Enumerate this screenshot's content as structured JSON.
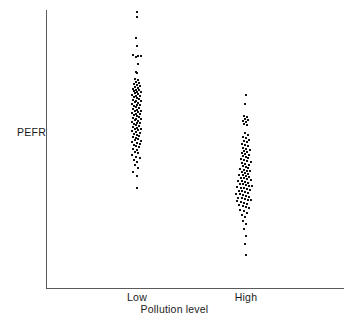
{
  "chart_data": {
    "type": "scatter",
    "title": "",
    "subtitle": "",
    "xlabel": "Pollution level",
    "ylabel": "PEFR",
    "grid": false,
    "legend": null,
    "categories": [
      "Low",
      "High"
    ],
    "marker": "small-filled-square",
    "marker_color": "#111111",
    "axis_color": "#5a5a5a",
    "background": "#ffffff",
    "axis_pixel_frame": {
      "y_axis_x": 46,
      "y_axis_top": 10,
      "y_axis_bottom": 288,
      "x_axis_left": 46,
      "x_axis_right": 344,
      "x_axis_y": 288
    },
    "group_centers_px": {
      "Low": 137,
      "High": 246
    },
    "series": [
      {
        "name": "Low",
        "category": "Low",
        "n": 103,
        "center_x_px": 137,
        "y_range_px": [
          12,
          188
        ],
        "points_px": [
          [
            137,
            12
          ],
          [
            137,
            17
          ],
          [
            136,
            38
          ],
          [
            137,
            46
          ],
          [
            133,
            55
          ],
          [
            138,
            56
          ],
          [
            141,
            56
          ],
          [
            136,
            57
          ],
          [
            138,
            64
          ],
          [
            136,
            72
          ],
          [
            137,
            73
          ],
          [
            135,
            79
          ],
          [
            138,
            80
          ],
          [
            136,
            82
          ],
          [
            139,
            83
          ],
          [
            134,
            84
          ],
          [
            137,
            85
          ],
          [
            140,
            86
          ],
          [
            135,
            87
          ],
          [
            138,
            88
          ],
          [
            133,
            89
          ],
          [
            136,
            90
          ],
          [
            139,
            90
          ],
          [
            134,
            91
          ],
          [
            137,
            92
          ],
          [
            141,
            92
          ],
          [
            135,
            93
          ],
          [
            138,
            94
          ],
          [
            132,
            95
          ],
          [
            136,
            96
          ],
          [
            140,
            96
          ],
          [
            134,
            97
          ],
          [
            137,
            98
          ],
          [
            139,
            99
          ],
          [
            133,
            100
          ],
          [
            136,
            101
          ],
          [
            141,
            101
          ],
          [
            135,
            102
          ],
          [
            138,
            103
          ],
          [
            132,
            104
          ],
          [
            137,
            105
          ],
          [
            140,
            105
          ],
          [
            134,
            106
          ],
          [
            136,
            107
          ],
          [
            139,
            108
          ],
          [
            133,
            109
          ],
          [
            137,
            110
          ],
          [
            135,
            111
          ],
          [
            141,
            111
          ],
          [
            138,
            112
          ],
          [
            132,
            113
          ],
          [
            136,
            114
          ],
          [
            140,
            114
          ],
          [
            134,
            115
          ],
          [
            137,
            116
          ],
          [
            139,
            117
          ],
          [
            133,
            118
          ],
          [
            136,
            119
          ],
          [
            141,
            119
          ],
          [
            135,
            120
          ],
          [
            138,
            121
          ],
          [
            132,
            122
          ],
          [
            137,
            123
          ],
          [
            140,
            123
          ],
          [
            134,
            124
          ],
          [
            136,
            125
          ],
          [
            139,
            126
          ],
          [
            133,
            127
          ],
          [
            137,
            128
          ],
          [
            135,
            129
          ],
          [
            141,
            129
          ],
          [
            138,
            130
          ],
          [
            132,
            131
          ],
          [
            136,
            132
          ],
          [
            140,
            133
          ],
          [
            134,
            134
          ],
          [
            137,
            135
          ],
          [
            139,
            136
          ],
          [
            133,
            137
          ],
          [
            136,
            138
          ],
          [
            138,
            139
          ],
          [
            135,
            140
          ],
          [
            141,
            141
          ],
          [
            132,
            142
          ],
          [
            137,
            143
          ],
          [
            140,
            144
          ],
          [
            134,
            145
          ],
          [
            136,
            146
          ],
          [
            139,
            147
          ],
          [
            133,
            149
          ],
          [
            137,
            150
          ],
          [
            135,
            152
          ],
          [
            138,
            153
          ],
          [
            132,
            155
          ],
          [
            136,
            157
          ],
          [
            140,
            158
          ],
          [
            134,
            160
          ],
          [
            137,
            162
          ],
          [
            135,
            165
          ],
          [
            138,
            168
          ],
          [
            133,
            172
          ],
          [
            137,
            176
          ],
          [
            137,
            188
          ]
        ]
      },
      {
        "name": "High",
        "category": "High",
        "n": 103,
        "center_x_px": 246,
        "y_range_px": [
          95,
          255
        ],
        "points_px": [
          [
            246,
            95
          ],
          [
            245,
            104
          ],
          [
            244,
            116
          ],
          [
            247,
            117
          ],
          [
            245,
            119
          ],
          [
            248,
            120
          ],
          [
            243,
            121
          ],
          [
            246,
            122
          ],
          [
            244,
            124
          ],
          [
            247,
            125
          ],
          [
            245,
            133
          ],
          [
            248,
            135
          ],
          [
            243,
            137
          ],
          [
            246,
            138
          ],
          [
            249,
            140
          ],
          [
            244,
            141
          ],
          [
            247,
            142
          ],
          [
            242,
            144
          ],
          [
            245,
            145
          ],
          [
            248,
            146
          ],
          [
            243,
            148
          ],
          [
            246,
            149
          ],
          [
            250,
            150
          ],
          [
            244,
            151
          ],
          [
            247,
            152
          ],
          [
            242,
            153
          ],
          [
            245,
            154
          ],
          [
            249,
            155
          ],
          [
            243,
            156
          ],
          [
            246,
            157
          ],
          [
            248,
            158
          ],
          [
            241,
            159
          ],
          [
            244,
            160
          ],
          [
            247,
            161
          ],
          [
            251,
            162
          ],
          [
            242,
            163
          ],
          [
            245,
            164
          ],
          [
            249,
            165
          ],
          [
            243,
            166
          ],
          [
            246,
            167
          ],
          [
            248,
            168
          ],
          [
            240,
            169
          ],
          [
            244,
            170
          ],
          [
            247,
            171
          ],
          [
            250,
            171
          ],
          [
            242,
            172
          ],
          [
            245,
            173
          ],
          [
            248,
            174
          ],
          [
            239,
            175
          ],
          [
            243,
            175
          ],
          [
            246,
            176
          ],
          [
            249,
            177
          ],
          [
            241,
            178
          ],
          [
            244,
            178
          ],
          [
            247,
            179
          ],
          [
            251,
            180
          ],
          [
            238,
            181
          ],
          [
            242,
            181
          ],
          [
            245,
            182
          ],
          [
            248,
            183
          ],
          [
            240,
            184
          ],
          [
            243,
            184
          ],
          [
            246,
            185
          ],
          [
            249,
            186
          ],
          [
            252,
            186
          ],
          [
            237,
            187
          ],
          [
            241,
            188
          ],
          [
            244,
            188
          ],
          [
            247,
            189
          ],
          [
            250,
            190
          ],
          [
            239,
            191
          ],
          [
            242,
            191
          ],
          [
            245,
            192
          ],
          [
            248,
            193
          ],
          [
            236,
            194
          ],
          [
            240,
            194
          ],
          [
            243,
            195
          ],
          [
            246,
            196
          ],
          [
            249,
            197
          ],
          [
            238,
            198
          ],
          [
            242,
            198
          ],
          [
            245,
            199
          ],
          [
            248,
            200
          ],
          [
            251,
            200
          ],
          [
            237,
            201
          ],
          [
            241,
            202
          ],
          [
            244,
            203
          ],
          [
            247,
            204
          ],
          [
            239,
            205
          ],
          [
            243,
            206
          ],
          [
            246,
            207
          ],
          [
            249,
            208
          ],
          [
            240,
            210
          ],
          [
            244,
            211
          ],
          [
            247,
            213
          ],
          [
            242,
            215
          ],
          [
            245,
            217
          ],
          [
            243,
            221
          ],
          [
            246,
            224
          ],
          [
            244,
            229
          ],
          [
            246,
            236
          ],
          [
            245,
            244
          ],
          [
            246,
            255
          ]
        ]
      }
    ]
  },
  "figure": {
    "ylabel": "PEFR",
    "xlabel": "Pollution level",
    "tick_labels": [
      "Low",
      "High"
    ]
  }
}
